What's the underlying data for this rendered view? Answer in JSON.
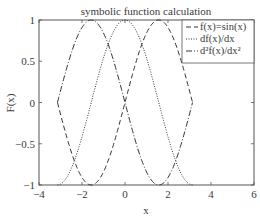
{
  "chart_data": {
    "type": "line",
    "title": "symbolic function calculation",
    "xlabel": "x",
    "ylabel": "F(x)",
    "xlim": [
      -4,
      6
    ],
    "ylim": [
      -1,
      1
    ],
    "xticks": [
      -4,
      -2,
      0,
      2,
      4,
      6
    ],
    "xtick_labels": [
      "−4",
      "−2",
      "0",
      "2",
      "4",
      "6"
    ],
    "yticks": [
      -1,
      -0.5,
      0,
      0.5,
      1
    ],
    "ytick_labels": [
      "−1",
      "−0.5",
      "0",
      "0.5",
      "1"
    ],
    "grid": false,
    "legend_position": "upper right",
    "x_domain": [
      -3.1416,
      3.1416
    ],
    "series": [
      {
        "name": "f(x)=sin(x)",
        "legend": "f(x)=sin(x)",
        "expr": "sin",
        "style": "dashed",
        "x": [
          -3.1416,
          -1.5708,
          0,
          1.5708,
          3.1416
        ],
        "values": [
          0,
          -1,
          0,
          1,
          0
        ]
      },
      {
        "name": "df(x)/dx",
        "legend": "df(x)/dx",
        "expr": "cos",
        "style": "dotted",
        "x": [
          -3.1416,
          -1.5708,
          0,
          1.5708,
          3.1416
        ],
        "values": [
          -1,
          0,
          1,
          0,
          -1
        ]
      },
      {
        "name": "d²f(x)/dx²",
        "legend": "d²f(x)/dx²",
        "expr": "-sin",
        "style": "dashdot",
        "x": [
          -3.1416,
          -1.5708,
          0,
          1.5708,
          3.1416
        ],
        "values": [
          0,
          1,
          0,
          -1,
          0
        ]
      }
    ]
  }
}
